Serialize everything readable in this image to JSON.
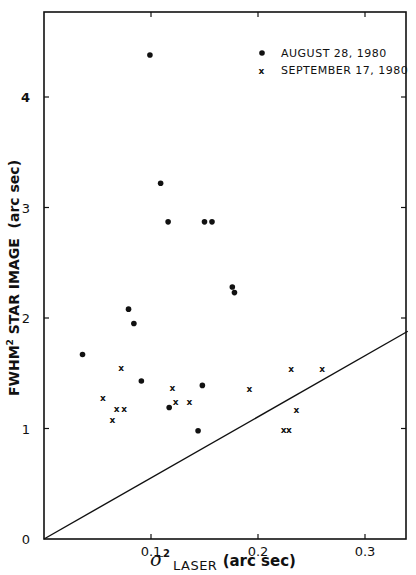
{
  "chart_data": {
    "type": "scatter",
    "title": "",
    "xlabel": "σ² LASER (arc sec)",
    "ylabel": "FWHM² STAR IMAGE (arc sec)",
    "xlabel_parts": {
      "symbol": "σ",
      "sup": "2",
      "sub": "LASER",
      "unit": "(arc sec)"
    },
    "ylabel_parts": {
      "main": "FWHM",
      "sup": "2",
      "rest": " STAR IMAGE  (arc sec)"
    },
    "xlim": [
      0,
      0.34
    ],
    "ylim": [
      0,
      4.7
    ],
    "x_ticks": [
      0.1,
      0.2,
      0.3
    ],
    "x_tick_labels": [
      "0.1",
      "0.2",
      "0.3"
    ],
    "y_ticks": [
      0,
      1,
      2,
      3,
      4
    ],
    "y_tick_labels": [
      "0",
      "1",
      "2",
      "3",
      "4"
    ],
    "grid": false,
    "legend_position": "upper right",
    "series": [
      {
        "name": "AUGUST 28, 1980",
        "marker": "filled-circle",
        "points": [
          [
            0.036,
            1.67
          ],
          [
            0.079,
            2.08
          ],
          [
            0.084,
            1.95
          ],
          [
            0.091,
            1.43
          ],
          [
            0.099,
            4.38
          ],
          [
            0.109,
            3.22
          ],
          [
            0.116,
            2.87
          ],
          [
            0.117,
            1.19
          ],
          [
            0.144,
            0.98
          ],
          [
            0.148,
            1.39
          ],
          [
            0.15,
            2.87
          ],
          [
            0.157,
            2.87
          ],
          [
            0.176,
            2.28
          ],
          [
            0.178,
            2.23
          ]
        ]
      },
      {
        "name": "SEPTEMBER 17, 1980",
        "marker": "x",
        "points": [
          [
            0.055,
            1.28
          ],
          [
            0.064,
            1.08
          ],
          [
            0.068,
            1.18
          ],
          [
            0.072,
            1.55
          ],
          [
            0.075,
            1.18
          ],
          [
            0.12,
            1.37
          ],
          [
            0.123,
            1.24
          ],
          [
            0.136,
            1.24
          ],
          [
            0.192,
            1.36
          ],
          [
            0.224,
            0.99
          ],
          [
            0.229,
            0.99
          ],
          [
            0.231,
            1.54
          ],
          [
            0.236,
            1.17
          ],
          [
            0.26,
            1.54
          ]
        ]
      }
    ],
    "reference_line": {
      "from": [
        0,
        0
      ],
      "to": [
        0.34,
        1.88
      ],
      "description": "straight line through origin"
    }
  },
  "legend": {
    "entries": [
      {
        "marker": "•",
        "label": "AUGUST 28, 1980"
      },
      {
        "marker": "x",
        "label": "SEPTEMBER 17, 1980"
      }
    ]
  }
}
